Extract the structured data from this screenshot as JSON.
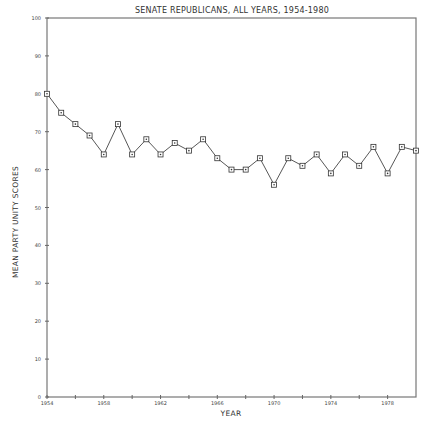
{
  "chart_data": {
    "type": "line",
    "title": "SENATE REPUBLICANS, ALL YEARS, 1954-1980",
    "xlabel": "YEAR",
    "ylabel": "MEAN PARTY UNITY SCORES",
    "x": [
      1954,
      1955,
      1956,
      1957,
      1958,
      1959,
      1960,
      1961,
      1962,
      1963,
      1964,
      1965,
      1966,
      1967,
      1968,
      1969,
      1970,
      1971,
      1972,
      1973,
      1974,
      1975,
      1976,
      1977,
      1978,
      1979,
      1980
    ],
    "series": [
      {
        "name": "Senate Republicans",
        "values": [
          80,
          75,
          72,
          69,
          64,
          72,
          64,
          68,
          64,
          67,
          65,
          68,
          63,
          60,
          60,
          63,
          56,
          63,
          61,
          64,
          59,
          64,
          61,
          66,
          59,
          66,
          65
        ],
        "marker": "square",
        "color": "#333333"
      }
    ],
    "xlim": [
      1954,
      1980
    ],
    "ylim": [
      0,
      100
    ],
    "x_tick_labels": [
      "1954",
      "1958",
      "1962",
      "1966",
      "1970",
      "1974",
      "1978"
    ],
    "x_minor_tick_step": 2,
    "y_tick_labels": [
      "0",
      "10",
      "20",
      "30",
      "40",
      "50",
      "60",
      "70",
      "80",
      "90",
      "100"
    ],
    "grid": false,
    "legend": null,
    "frame": "box"
  }
}
